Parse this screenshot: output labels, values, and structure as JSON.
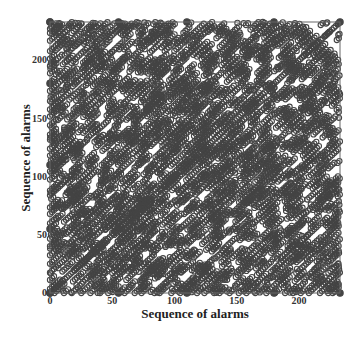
{
  "chart_data": {
    "type": "scatter",
    "title": "",
    "xlabel": "Sequence of alarms",
    "ylabel": "Sequence of alarms",
    "xlim": [
      0,
      233
    ],
    "ylim": [
      0,
      233
    ],
    "xticks": [
      0,
      50,
      100,
      150,
      200
    ],
    "yticks": [
      0,
      50,
      100,
      150,
      200
    ],
    "grid": false,
    "legend": null,
    "marker": "open circle",
    "pattern": {
      "diagonal_period": 14,
      "streak_length": 10,
      "seed": 7
    },
    "edge_points": {
      "x_axis": [
        0,
        55,
        110,
        180,
        233
      ],
      "y_axis": [
        0,
        55,
        110,
        180,
        233
      ]
    },
    "color": "#444444"
  }
}
